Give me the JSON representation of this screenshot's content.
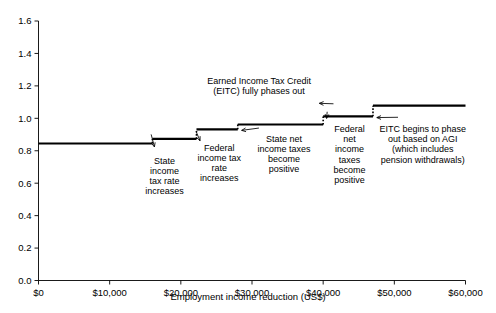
{
  "chart_data": {
    "type": "line",
    "subtype": "step",
    "title": "",
    "xlabel": "Employment income reduction (US$)",
    "ylabel": "",
    "xlim": [
      0,
      60000
    ],
    "ylim": [
      0.0,
      1.6
    ],
    "xticks": [
      0,
      10000,
      20000,
      30000,
      40000,
      50000,
      60000
    ],
    "xtick_labels": [
      "$0",
      "$10,000",
      "$20,000",
      "$30,000",
      "$40,000",
      "$50,000",
      "$60,000"
    ],
    "yticks": [
      0.0,
      0.2,
      0.4,
      0.6,
      0.8,
      1.0,
      1.2,
      1.4,
      1.6
    ],
    "ytick_labels": [
      "0.0",
      "0.2",
      "0.4",
      "0.6",
      "0.8",
      "1.0",
      "1.2",
      "1.4",
      "1.6"
    ],
    "grid": false,
    "legend": "none",
    "series": [
      {
        "name": "Effective marginal cost of income reduction",
        "step_points": [
          {
            "x": 0,
            "y": 0.845
          },
          {
            "x": 16000,
            "y": 0.873
          },
          {
            "x": 22200,
            "y": 0.932
          },
          {
            "x": 28000,
            "y": 0.962
          },
          {
            "x": 40000,
            "y": 1.012
          },
          {
            "x": 47000,
            "y": 1.078
          },
          {
            "x": 60000,
            "y": 1.078
          }
        ]
      }
    ],
    "annotations": [
      {
        "id": "state-income-tax-rate",
        "text": "State\nincome\ntax rate\nincreases",
        "lines": [
          "State",
          "income",
          "tax rate",
          "increases"
        ],
        "target_x": 16000,
        "target_y": 0.845,
        "text_x": 17700,
        "text_y": 0.72
      },
      {
        "id": "federal-income-tax-rate",
        "text": "Federal\nincome tax\nrate\nincreases",
        "lines": [
          "Federal",
          "income tax",
          "rate",
          "increases"
        ],
        "target_x": 22200,
        "target_y": 0.873,
        "text_x": 25400,
        "text_y": 0.8
      },
      {
        "id": "state-net-income-taxes",
        "text": "State net\nincome taxes\nbecome\npositive",
        "lines": [
          "State net",
          "income taxes",
          "become",
          "positive"
        ],
        "target_x": 28000,
        "target_y": 0.932,
        "text_x": 34500,
        "text_y": 0.855
      },
      {
        "id": "eitc-fully-phases-out",
        "text": "Earned Income Tax Credit\n(EITC) fully phases out",
        "lines": [
          "Earned Income Tax Credit",
          "(EITC) fully phases out"
        ],
        "target_x": 40000,
        "target_y": 1.085,
        "text_x": 31000,
        "text_y": 1.21
      },
      {
        "id": "federal-net-income-taxes",
        "text": "Federal\nnet\nincome\ntaxes\nbecome\npositive",
        "lines": [
          "Federal",
          "net",
          "income",
          "taxes",
          "become",
          "positive"
        ],
        "target_x": 40000,
        "target_y": 1.012,
        "text_x": 43700,
        "text_y": 0.915
      },
      {
        "id": "eitc-begins-phase-out",
        "text": "EITC begins to phase\nout based on AGI\n(which includes\npension withdrawals)",
        "lines": [
          "EITC begins to phase",
          "out based on AGI",
          "(which includes",
          "pension withdrawals)"
        ],
        "target_x": 47000,
        "target_y": 1.012,
        "text_x": 54000,
        "text_y": 0.915
      }
    ],
    "colors": {
      "line": "#000000",
      "axis": "#000000",
      "background": "#ffffff",
      "text": "#000000"
    }
  }
}
